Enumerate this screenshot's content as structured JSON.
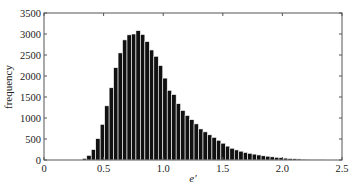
{
  "chart_data": {
    "type": "bar",
    "title": "",
    "xlabel": "e′",
    "ylabel": "frequency",
    "xlim": [
      0,
      2.5
    ],
    "ylim": [
      0,
      3500
    ],
    "xticks": [
      0,
      0.5,
      1.0,
      1.5,
      2.0,
      2.5
    ],
    "xtick_labels": [
      "0",
      "0.5",
      "1.0",
      "1.5",
      "2.0",
      "2.5"
    ],
    "yticks": [
      0,
      500,
      1000,
      1500,
      2000,
      2500,
      3000,
      3500
    ],
    "ytick_labels": [
      "0",
      "500",
      "1000",
      "1500",
      "2000",
      "2500",
      "3000",
      "3500"
    ],
    "grid": false,
    "legend": null,
    "bin_width": 0.0375,
    "bin_centers": [
      0.34,
      0.3775,
      0.415,
      0.4525,
      0.49,
      0.5275,
      0.565,
      0.6025,
      0.64,
      0.6775,
      0.715,
      0.7525,
      0.79,
      0.8275,
      0.865,
      0.9025,
      0.94,
      0.9775,
      1.015,
      1.0525,
      1.09,
      1.1275,
      1.165,
      1.2025,
      1.24,
      1.2775,
      1.315,
      1.3525,
      1.39,
      1.4275,
      1.465,
      1.5025,
      1.54,
      1.5775,
      1.615,
      1.6525,
      1.69,
      1.7275,
      1.765,
      1.8025,
      1.84,
      1.8775,
      1.915,
      1.9525,
      1.99,
      2.0275,
      2.065,
      2.1025,
      2.14,
      2.1775,
      2.215,
      2.2525,
      2.29,
      2.3275
    ],
    "values": [
      40,
      110,
      250,
      510,
      850,
      1290,
      1720,
      2200,
      2550,
      2860,
      2980,
      3000,
      3080,
      2990,
      2820,
      2620,
      2470,
      2250,
      1950,
      1660,
      1560,
      1340,
      1180,
      1060,
      960,
      860,
      740,
      670,
      600,
      540,
      470,
      400,
      330,
      280,
      240,
      210,
      180,
      160,
      140,
      120,
      100,
      90,
      75,
      65,
      55,
      45,
      35,
      30,
      25,
      20,
      18,
      15,
      12,
      10
    ],
    "bar_color": "#111111",
    "bar_edge_color": "#ffffff"
  }
}
